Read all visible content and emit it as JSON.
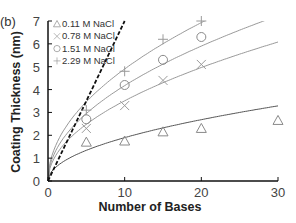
{
  "chart_data": {
    "type": "scatter",
    "panel_label": "(b)",
    "title": "",
    "xlabel": "Number of Bases",
    "ylabel": "Coating Thickness (nm)",
    "xlim": [
      0,
      30
    ],
    "ylim": [
      0,
      7
    ],
    "xticks": [
      0,
      10,
      20,
      30
    ],
    "yticks": [
      0,
      1,
      2,
      3,
      4,
      5,
      6,
      7
    ],
    "grid": false,
    "legend_position": "upper-left",
    "series": [
      {
        "name": "0.11 M NaCl",
        "marker": "triangle",
        "color": "#8a8a8a",
        "x": [
          5,
          10,
          15,
          20,
          30
        ],
        "y": [
          1.7,
          1.75,
          2.15,
          2.3,
          2.65
        ],
        "fit_coef": 0.6
      },
      {
        "name": "0.78 M NaCl",
        "marker": "x",
        "color": "#9a9a9a",
        "x": [
          5,
          10,
          15,
          20
        ],
        "y": [
          2.3,
          3.3,
          4.4,
          5.1
        ],
        "fit_coef": 1.11
      },
      {
        "name": "1.51 M NaCl",
        "marker": "circle",
        "color": "#8a8a8a",
        "x": [
          5,
          10,
          15,
          20
        ],
        "y": [
          2.7,
          4.2,
          5.3,
          6.3
        ],
        "fit_coef": 1.32
      },
      {
        "name": "2.29 M NaCl",
        "marker": "plus",
        "color": "#9a9a9a",
        "x": [
          5,
          10,
          15,
          20
        ],
        "y": [
          3.1,
          4.8,
          6.2,
          7.0
        ],
        "fit_coef": 1.55
      }
    ],
    "fits": "power-law (sqrt) fit curves through origin for each series",
    "reference_line": {
      "style": "dashed",
      "color": "#111111",
      "slope": 0.7,
      "description": "linear reference through origin"
    }
  }
}
